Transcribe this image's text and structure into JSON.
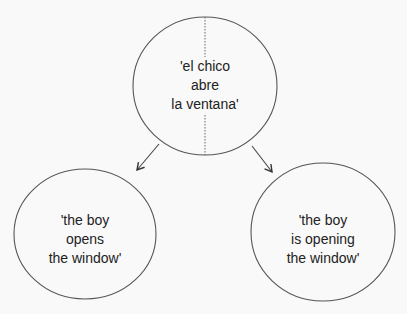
{
  "diagram": {
    "top_node": {
      "lines": [
        "'el chico",
        "abre",
        "la ventana'"
      ],
      "divided": true
    },
    "left_node": {
      "lines": [
        "'the boy",
        "opens",
        "the window'"
      ]
    },
    "right_node": {
      "lines": [
        "'the boy",
        "is opening",
        "the window'"
      ]
    },
    "edges": [
      {
        "from": "top_node",
        "to": "left_node"
      },
      {
        "from": "top_node",
        "to": "right_node"
      }
    ],
    "colors": {
      "stroke": "#444444",
      "background": "#f9f9f9",
      "text": "#222222"
    }
  }
}
